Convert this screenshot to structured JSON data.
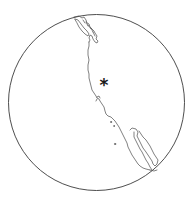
{
  "map": {
    "projection": "orthographic",
    "region": "North America west coast",
    "globe": {
      "cx": 96.5,
      "cy": 102.5,
      "r": 88,
      "stroke": "#3a3a3a",
      "fill": "#ffffff"
    },
    "marker": {
      "symbol": "*",
      "x": 104,
      "y": 82,
      "icon": "asterisk-marker-icon",
      "color": "#1a1a1a"
    },
    "coast_color": "#4a4a4a",
    "features": [
      {
        "name": "british-columbia-coast-and-islands"
      },
      {
        "name": "pacific-coastline"
      },
      {
        "name": "baja-california-peninsula"
      },
      {
        "name": "gulf-of-california"
      },
      {
        "name": "channel-islands"
      }
    ]
  }
}
